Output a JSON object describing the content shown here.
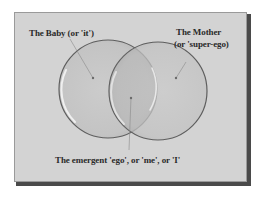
{
  "diagram": {
    "type": "venn",
    "labels": {
      "baby": "The Baby (or 'it')",
      "mother_line1": "The Mother",
      "mother_line2": "(or 'super-ego)",
      "ego": "The emergent 'ego', or 'me', or 'I'"
    },
    "sets": [
      {
        "name": "The Baby (or 'it')",
        "cx": 108,
        "cy": 89,
        "r": 49
      },
      {
        "name": "The Mother (or 'super-ego)",
        "cx": 158,
        "cy": 91,
        "r": 49
      }
    ],
    "intersection": {
      "name": "The emergent 'ego', or 'me', or 'I'"
    },
    "colors": {
      "frame_bg": "#d3d3d3",
      "circle_fill": "#c4c4c4",
      "circle_stroke": "#5e5e5e",
      "highlight": "#f4f4f4",
      "text": "#2a2a2a"
    }
  }
}
